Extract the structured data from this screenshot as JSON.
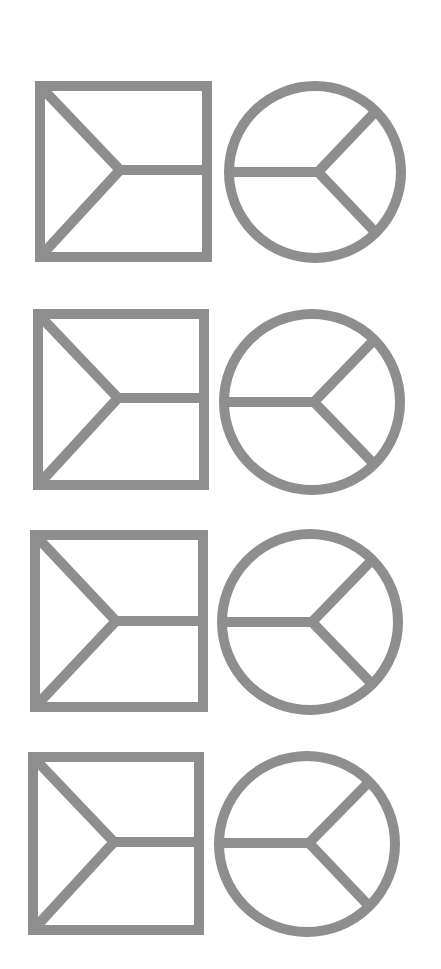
{
  "diagram": {
    "stroke_color": "#8e8e8e",
    "background": "#ffffff",
    "stroke_width": 10,
    "rows": [
      {
        "square": {
          "x": 40,
          "y": 86,
          "w": 167,
          "h": 171,
          "junction": [
            120,
            170
          ],
          "branch_right_y": 170
        },
        "circle": {
          "cx": 315,
          "cy": 172,
          "r": 86,
          "junction": [
            318,
            172
          ]
        }
      },
      {
        "square": {
          "x": 38,
          "y": 314,
          "w": 166,
          "h": 171,
          "junction": [
            118,
            398
          ]
        },
        "circle": {
          "cx": 312,
          "cy": 402,
          "r": 88,
          "junction": [
            314,
            402
          ]
        }
      },
      {
        "square": {
          "x": 35,
          "y": 535,
          "w": 168,
          "h": 172,
          "junction": [
            116,
            621
          ]
        },
        "circle": {
          "cx": 310,
          "cy": 622,
          "r": 88,
          "junction": [
            312,
            622
          ]
        }
      },
      {
        "square": {
          "x": 33,
          "y": 757,
          "w": 166,
          "h": 173,
          "junction": [
            114,
            842
          ]
        },
        "circle": {
          "cx": 307,
          "cy": 844,
          "r": 88,
          "junction": [
            309,
            843
          ]
        }
      }
    ]
  }
}
